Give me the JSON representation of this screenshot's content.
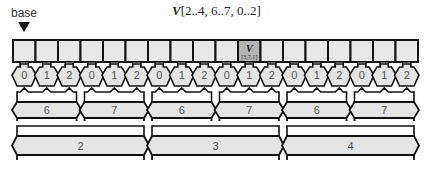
{
  "title": {
    "var": "V",
    "ranges": "[2..4, 6..7, 0..2]"
  },
  "base_label": "base",
  "cells": {
    "count": 18,
    "highlight_index": 10,
    "highlight_label": "V",
    "highlight_sub": "[3,7,1]"
  },
  "levels": {
    "k_labels": [
      "0",
      "1",
      "2",
      "0",
      "1",
      "2",
      "0",
      "1",
      "2",
      "0",
      "1",
      "2",
      "0",
      "1",
      "2",
      "0",
      "1",
      "2"
    ],
    "j_labels": [
      "6",
      "7",
      "6",
      "7",
      "6",
      "7"
    ],
    "i_labels": [
      "2",
      "3",
      "4"
    ]
  },
  "colors": {
    "cell_fill": "#e8e8e8",
    "highlight_fill": "#b4b4b4",
    "band_fill": "#e4e4e4",
    "stroke": "#111111"
  }
}
